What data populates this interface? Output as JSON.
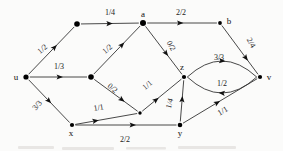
{
  "figure": {
    "kind": "flow-network-diagram",
    "title": "",
    "background_color": "#fbfbfa",
    "stroke_color": "#343434",
    "node_color": "#000000"
  },
  "nodes": [
    {
      "id": "u",
      "label": "u",
      "x": 26,
      "y": 77,
      "label_dx": -10,
      "label_dy": 3,
      "r": 2.6
    },
    {
      "id": "n1",
      "label": "",
      "x": 77,
      "y": 24,
      "label_dx": 0,
      "label_dy": 0,
      "r": 2.8
    },
    {
      "id": "a",
      "label": "a",
      "x": 143,
      "y": 23,
      "label_dx": 0,
      "label_dy": -6,
      "r": 3.0
    },
    {
      "id": "b",
      "label": "b",
      "x": 220,
      "y": 23,
      "label_dx": 9,
      "label_dy": 1,
      "r": 1.9
    },
    {
      "id": "m",
      "label": "",
      "x": 91,
      "y": 77,
      "label_dx": 0,
      "label_dy": 0,
      "r": 2.8
    },
    {
      "id": "z",
      "label": "z",
      "x": 184,
      "y": 77,
      "label_dx": -2,
      "label_dy": -7,
      "r": 2.1
    },
    {
      "id": "v",
      "label": "v",
      "x": 260,
      "y": 77,
      "label_dx": 9,
      "label_dy": 3,
      "r": 2.1
    },
    {
      "id": "x",
      "label": "x",
      "x": 72,
      "y": 125,
      "label_dx": -1,
      "label_dy": 11,
      "r": 2.1
    },
    {
      "id": "p",
      "label": "",
      "x": 140,
      "y": 113,
      "label_dx": 0,
      "label_dy": 0,
      "r": 1.7
    },
    {
      "id": "y",
      "label": "y",
      "x": 180,
      "y": 125,
      "label_dx": 0,
      "label_dy": 11,
      "r": 2.3
    }
  ],
  "edges": [
    {
      "id": "e-u-n1",
      "from": "u",
      "to": "n1",
      "label": "1/2",
      "label_x": 44,
      "label_y": 51,
      "label_rot": -40,
      "arrow_t": 0.62,
      "curve": 0
    },
    {
      "id": "e-n1-a",
      "from": "n1",
      "to": "a",
      "label": "1/4",
      "label_x": 110,
      "label_y": 15,
      "label_rot": 0,
      "arrow_t": 0.55,
      "curve": 0
    },
    {
      "id": "e-a-b",
      "from": "a",
      "to": "b",
      "label": "2/2",
      "label_x": 181,
      "label_y": 15,
      "label_rot": 0,
      "arrow_t": 0.52,
      "curve": 0
    },
    {
      "id": "e-u-m",
      "from": "u",
      "to": "m",
      "label": "1/3",
      "label_x": 59,
      "label_y": 69,
      "label_rot": 0,
      "arrow_t": 0.58,
      "curve": 0
    },
    {
      "id": "e-m-a",
      "from": "m",
      "to": "a",
      "label": "1/2",
      "label_x": 109,
      "label_y": 51,
      "label_rot": -40,
      "arrow_t": 0.66,
      "curve": 0
    },
    {
      "id": "e-a-z",
      "from": "a",
      "to": "z",
      "label": "0/2",
      "label_x": 169,
      "label_y": 47,
      "label_rot": 61,
      "arrow_t": 0.62,
      "curve": 0
    },
    {
      "id": "e-b-v",
      "from": "b",
      "to": "v",
      "label": "2/4",
      "label_x": 249,
      "label_y": 44,
      "label_rot": 60,
      "arrow_t": 0.72,
      "curve": 0
    },
    {
      "id": "e-u-x",
      "from": "u",
      "to": "x",
      "label": "3/3",
      "label_x": 39,
      "label_y": 107,
      "label_rot": -49,
      "arrow_t": 0.55,
      "curve": 0
    },
    {
      "id": "e-m-p",
      "from": "m",
      "to": "p",
      "label": "0/2",
      "label_x": 111,
      "label_y": 90,
      "label_rot": 40,
      "arrow_t": 0.7,
      "curve": 0
    },
    {
      "id": "e-p-z",
      "from": "p",
      "to": "z",
      "label": "1/1",
      "label_x": 149,
      "label_y": 87,
      "label_rot": -40,
      "arrow_t": 0.42,
      "curve": 0
    },
    {
      "id": "e-x-p",
      "from": "x",
      "to": "p",
      "label": "1/1",
      "label_x": 99,
      "label_y": 110,
      "label_rot": -9,
      "arrow_t": 0.38,
      "curve": 0
    },
    {
      "id": "e-x-y",
      "from": "x",
      "to": "y",
      "label": "2/2",
      "label_x": 125,
      "label_y": 142,
      "label_rot": 0,
      "arrow_t": 0.6,
      "curve": 0
    },
    {
      "id": "e-y-z",
      "from": "y",
      "to": "z",
      "label": "1/4",
      "label_x": 172,
      "label_y": 104,
      "label_rot": -75,
      "arrow_t": 0.62,
      "curve": 0
    },
    {
      "id": "e-y-v",
      "from": "y",
      "to": "v",
      "label": "1/1",
      "label_x": 224,
      "label_y": 113,
      "label_rot": -31,
      "arrow_t": 0.5,
      "curve": 0
    },
    {
      "id": "e-z-v",
      "from": "z",
      "to": "v",
      "label": "3/3",
      "label_x": 219,
      "label_y": 60,
      "label_rot": 0,
      "arrow_t": 0.55,
      "curve": -16
    },
    {
      "id": "e-v-z",
      "from": "v",
      "to": "z",
      "label": "1/2",
      "label_x": 222,
      "label_y": 86,
      "label_rot": 0,
      "arrow_t": 0.55,
      "curve": -16
    }
  ],
  "legend": {
    "note": "edge labels are flow/capacity pairs"
  }
}
